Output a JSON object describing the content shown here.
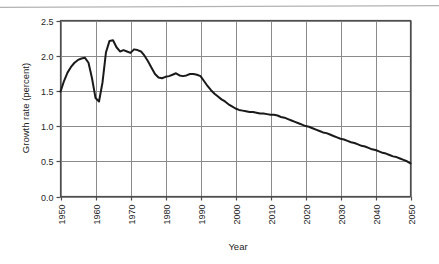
{
  "figure": {
    "background_color": "#ffffff",
    "ink_color": "#1a1a1a",
    "grid_color": "#8a8a8a",
    "axis_color": "#4d4d4d",
    "artifact_color": "#b3b3b3",
    "scan_artifact_name": "scanner-streak"
  },
  "chart_data": {
    "type": "line",
    "title": "",
    "subtitle": "",
    "xlabel": "Year",
    "ylabel": "Growth rate (percent)",
    "xlim": [
      1950,
      2050
    ],
    "ylim": [
      0.0,
      2.5
    ],
    "xticks": [
      1950,
      1960,
      1970,
      1980,
      1990,
      2000,
      2010,
      2020,
      2030,
      2040,
      2050
    ],
    "xtick_labels": [
      "1950",
      "1960",
      "1970",
      "1980",
      "1990",
      "2000",
      "2010",
      "2020",
      "2030",
      "2040",
      "2050"
    ],
    "xtick_label_rotation": -90,
    "yticks": [
      0.0,
      0.5,
      1.0,
      1.5,
      2.0,
      2.5
    ],
    "ytick_labels": [
      "0.0",
      "0.5",
      "1.0",
      "1.5",
      "2.0",
      "2.5"
    ],
    "grid": true,
    "grid_x": true,
    "grid_y": true,
    "legend": false,
    "legend_position": "none",
    "line_color": "#1a1a1a",
    "line_width": 2,
    "markers": false,
    "annotations": [],
    "series": [
      {
        "name": "World population growth rate",
        "x": [
          1950,
          1951,
          1952,
          1953,
          1954,
          1955,
          1956,
          1957,
          1958,
          1959,
          1960,
          1961,
          1962,
          1963,
          1964,
          1965,
          1966,
          1967,
          1968,
          1969,
          1970,
          1971,
          1972,
          1973,
          1974,
          1975,
          1976,
          1977,
          1978,
          1979,
          1980,
          1981,
          1982,
          1983,
          1984,
          1985,
          1986,
          1987,
          1988,
          1989,
          1990,
          1991,
          1992,
          1993,
          1994,
          1995,
          1996,
          1997,
          1998,
          1999,
          2000,
          2001,
          2002,
          2003,
          2004,
          2005,
          2006,
          2007,
          2008,
          2009,
          2010,
          2011,
          2012,
          2013,
          2014,
          2015,
          2016,
          2017,
          2018,
          2019,
          2020,
          2021,
          2022,
          2023,
          2024,
          2025,
          2026,
          2027,
          2028,
          2029,
          2030,
          2031,
          2032,
          2033,
          2034,
          2035,
          2036,
          2037,
          2038,
          2039,
          2040,
          2041,
          2042,
          2043,
          2044,
          2045,
          2046,
          2047,
          2048,
          2049,
          2050
        ],
        "values": [
          1.49,
          1.64,
          1.76,
          1.84,
          1.9,
          1.94,
          1.96,
          1.97,
          1.9,
          1.68,
          1.4,
          1.35,
          1.62,
          2.05,
          2.21,
          2.22,
          2.12,
          2.06,
          2.08,
          2.06,
          2.04,
          2.09,
          2.08,
          2.06,
          2.0,
          1.92,
          1.83,
          1.74,
          1.69,
          1.68,
          1.7,
          1.71,
          1.73,
          1.75,
          1.72,
          1.71,
          1.72,
          1.74,
          1.74,
          1.73,
          1.71,
          1.64,
          1.57,
          1.51,
          1.46,
          1.42,
          1.38,
          1.35,
          1.31,
          1.28,
          1.25,
          1.23,
          1.22,
          1.21,
          1.2,
          1.2,
          1.19,
          1.18,
          1.18,
          1.17,
          1.16,
          1.16,
          1.15,
          1.13,
          1.12,
          1.1,
          1.08,
          1.06,
          1.04,
          1.02,
          1.0,
          0.99,
          0.97,
          0.95,
          0.93,
          0.91,
          0.9,
          0.88,
          0.86,
          0.84,
          0.82,
          0.81,
          0.79,
          0.77,
          0.76,
          0.74,
          0.72,
          0.71,
          0.69,
          0.67,
          0.66,
          0.64,
          0.62,
          0.61,
          0.59,
          0.57,
          0.56,
          0.54,
          0.52,
          0.5,
          0.47
        ]
      }
    ]
  }
}
